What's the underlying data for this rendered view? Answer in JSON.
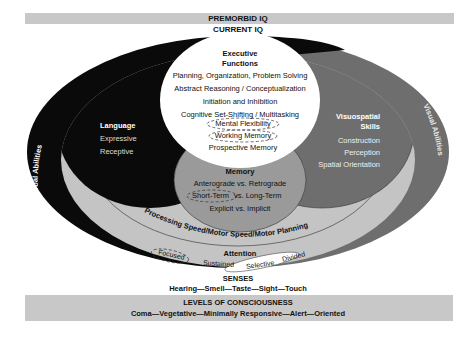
{
  "premorbid_iq": "PREMORBID IQ",
  "current_iq": "CURRENT IQ",
  "executive": {
    "title_line1": "Executive",
    "title_line2": "Functions",
    "items": [
      "Planning, Organization, Problem Solving",
      "Abstract Reasoning / Conceptualization",
      "Initiation and Inhibition",
      "Cognitive Set-Shifting / Multitasking",
      "Mental Flexibility",
      "Working Memory",
      "Prospective Memory"
    ]
  },
  "language": {
    "title": "Language",
    "items": [
      "Expressive",
      "Receptive"
    ]
  },
  "visuospatial": {
    "title_line1": "Visuospatial",
    "title_line2": "Skills",
    "items": [
      "Construction",
      "Perception",
      "Spatial Orientation"
    ]
  },
  "memory": {
    "title": "Memory",
    "items": [
      "Anterograde vs. Retrograde",
      "Short-Term",
      "vs. Long-Term",
      "Explicit vs. Implicit"
    ]
  },
  "verbal_abilities": "Verbal Abilities",
  "visual_abilities": "Visual Abilities",
  "processing_speed": "Processing Speed/Motor Speed/Motor Planning",
  "attention": {
    "title": "Attention",
    "items": [
      "Focused",
      "Sustained",
      "Selective",
      "Divided"
    ]
  },
  "senses": {
    "title": "SENSES",
    "items": "Hearing—Smell—Taste—Sight—Touch"
  },
  "consciousness": {
    "title": "LEVELS OF CONSCIOUSNESS",
    "items": "Coma—Vegetative—Minimally Responsive—Alert—Oriented"
  },
  "colors": {
    "verbal": "#0a0a0a",
    "visual": "#6e6e6e",
    "ring": "#c4c4c4",
    "memory": "#9a9a9a",
    "bars": "#c8c8c8"
  }
}
